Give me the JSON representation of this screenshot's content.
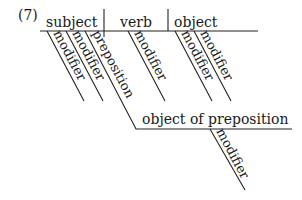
{
  "diagram": {
    "number": "(7)",
    "main_line": {
      "subject": "subject",
      "verb": "verb",
      "object": "object"
    },
    "subject_modifiers": [
      "modifier",
      "modifier"
    ],
    "preposition": "preposition",
    "verb_modifier": "modifier",
    "object_modifiers": [
      "modifier",
      "modifier"
    ],
    "object_of_preposition": "object of preposition",
    "object_of_preposition_modifier": "modifier"
  }
}
